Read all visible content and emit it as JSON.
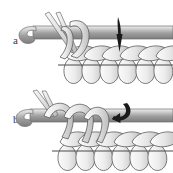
{
  "figure": {
    "kind": "crochet-stitch-instruction-diagram",
    "background_color": "#ffffff",
    "width": 173,
    "height": 173,
    "panel_count": 2
  },
  "panels": [
    {
      "id": "a",
      "label": "a",
      "caption": "",
      "arrow": {
        "name": "insert-hook-arrow",
        "shape": "straight-tapered-down",
        "direction": "down",
        "color": "#1a1a1a"
      },
      "elements": [
        "crochet-hook",
        "working-yarn-strands",
        "active-loops",
        "top-chain-row",
        "stitch-post-row",
        "foundation-line"
      ]
    },
    {
      "id": "b",
      "label": "b",
      "caption": "",
      "arrow": {
        "name": "pull-through-arrow",
        "shape": "curved-hook",
        "direction": "left-curving-down",
        "color": "#1a1a1a"
      },
      "elements": [
        "crochet-hook",
        "working-yarn-strands",
        "active-loops",
        "top-chain-row",
        "stitch-post-row",
        "foundation-line"
      ]
    }
  ],
  "colors": {
    "outline": "#5a5a5a",
    "yarn_light": "#f2f2f2",
    "yarn_mid": "#d4d4d4",
    "yarn_shadow": "#a8a8a8",
    "hook_light": "#e8e8e8",
    "hook_mid": "#b4b4b4",
    "hook_dark": "#8a8a8a",
    "arrow": "#1a1a1a",
    "label_text": "#3a3a3a",
    "background": "#ffffff"
  },
  "stitch_rows": {
    "top_chain_count": 6,
    "post_count": 6
  }
}
